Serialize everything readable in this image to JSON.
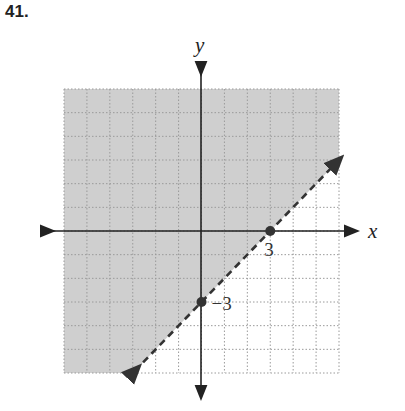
{
  "problem": {
    "number": "41."
  },
  "colors": {
    "shade": "#cfcfcf",
    "grid": "#9a9a9a",
    "axis": "#222222",
    "boundary": "#333333",
    "point": "#333333"
  },
  "axes": {
    "x_label": "x",
    "y_label": "y"
  },
  "labels": {
    "x_intercept": "3",
    "y_intercept": "−3"
  },
  "chart_data": {
    "type": "line",
    "title": "",
    "xlabel": "x",
    "ylabel": "y",
    "xlim": [
      -6,
      6
    ],
    "ylim": [
      -6,
      6
    ],
    "grid": true,
    "grid_step": 1,
    "series": [
      {
        "name": "boundary y = x - 3",
        "style": "dashed",
        "x": [
          -3,
          6
        ],
        "y": [
          -6,
          3
        ]
      }
    ],
    "points": [
      {
        "x": 3,
        "y": 0,
        "label": "3"
      },
      {
        "x": 0,
        "y": -3,
        "label": "-3"
      }
    ],
    "shaded_region": "above line (y > x - 3)",
    "inequality": "y > x - 3",
    "annotations": [
      "3",
      "-3"
    ]
  }
}
